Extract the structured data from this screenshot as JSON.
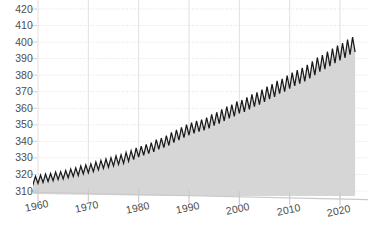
{
  "chart_data": {
    "type": "area",
    "title": "",
    "subtitle": "",
    "xlabel": "",
    "ylabel": "",
    "xlim": [
      1958,
      2023.5
    ],
    "ylim": [
      308,
      423
    ],
    "grid": true,
    "grid_style": "dotted",
    "legend": "none",
    "series_name": "Atmospheric CO2 concentration (ppm)",
    "line_color": "#1a1a1a",
    "fill_color": "#d6d6d6",
    "axis_color": "#c9c9c9",
    "grid_color": "#dcdcdc",
    "tick_text_color": "#4d4d4d",
    "ytick_labels": [
      "420",
      "410",
      "400",
      "390",
      "380",
      "370",
      "360",
      "350",
      "340",
      "330",
      "320",
      "310"
    ],
    "ytick_values": [
      420,
      410,
      400,
      390,
      380,
      370,
      360,
      350,
      340,
      330,
      320,
      310
    ],
    "xtick_labels": [
      "1960",
      "1970",
      "1980",
      "1990",
      "2000",
      "2010",
      "2020"
    ],
    "xtick_values": [
      1960,
      1970,
      1980,
      1990,
      2000,
      2010,
      2020
    ],
    "x": [
      1958.5,
      1959,
      1959.5,
      1960,
      1960.5,
      1961,
      1961.5,
      1962,
      1962.5,
      1963,
      1963.5,
      1964,
      1964.5,
      1965,
      1965.5,
      1966,
      1966.5,
      1967,
      1967.5,
      1968,
      1968.5,
      1969,
      1969.5,
      1970,
      1970.5,
      1971,
      1971.5,
      1972,
      1972.5,
      1973,
      1973.5,
      1974,
      1974.5,
      1975,
      1975.5,
      1976,
      1976.5,
      1977,
      1977.5,
      1978,
      1978.5,
      1979,
      1979.5,
      1980,
      1980.5,
      1981,
      1981.5,
      1982,
      1982.5,
      1983,
      1983.5,
      1984,
      1984.5,
      1985,
      1985.5,
      1986,
      1986.5,
      1987,
      1987.5,
      1988,
      1988.5,
      1989,
      1989.5,
      1990,
      1990.5,
      1991,
      1991.5,
      1992,
      1992.5,
      1993,
      1993.5,
      1994,
      1994.5,
      1995,
      1995.5,
      1996,
      1996.5,
      1997,
      1997.5,
      1998,
      1998.5,
      1999,
      1999.5,
      2000,
      2000.5,
      2001,
      2001.5,
      2002,
      2002.5,
      2003,
      2003.5,
      2004,
      2004.5,
      2005,
      2005.5,
      2006,
      2006.5,
      2007,
      2007.5,
      2008,
      2008.5,
      2009,
      2009.5,
      2010,
      2010.5,
      2011,
      2011.5,
      2012,
      2012.5,
      2013,
      2013.5,
      2014,
      2014.5,
      2015,
      2015.5,
      2016,
      2016.5,
      2017,
      2017.5,
      2018,
      2018.5,
      2019,
      2019.5,
      2020,
      2020.5,
      2021,
      2021.5,
      2022,
      2022.5,
      2023
    ],
    "y": [
      318.1,
      313.9,
      318.9,
      314.6,
      319.6,
      315.1,
      320.2,
      315.8,
      320.6,
      316.2,
      321.4,
      317.0,
      321.7,
      317.3,
      322.4,
      318.0,
      323.3,
      318.8,
      324.0,
      319.4,
      325.1,
      320.4,
      325.8,
      321.0,
      326.4,
      321.7,
      327.5,
      322.8,
      328.5,
      323.7,
      329.3,
      324.4,
      330.1,
      325.1,
      331.2,
      326.1,
      331.9,
      326.7,
      333.3,
      328.0,
      334.4,
      329.0,
      336.0,
      330.5,
      337.1,
      331.6,
      338.2,
      332.6,
      339.2,
      333.6,
      341.0,
      335.2,
      342.0,
      336.2,
      343.5,
      337.5,
      345.4,
      339.2,
      347.0,
      340.8,
      348.5,
      342.2,
      350.1,
      343.7,
      351.3,
      344.9,
      352.4,
      345.9,
      353.2,
      346.6,
      354.4,
      347.8,
      356.3,
      349.5,
      357.6,
      350.7,
      359.3,
      352.3,
      361.0,
      353.9,
      362.2,
      355.1,
      364.1,
      356.9,
      365.0,
      357.8,
      366.6,
      359.3,
      368.4,
      361.0,
      369.6,
      362.2,
      371.3,
      363.8,
      373.1,
      365.5,
      374.6,
      366.9,
      376.6,
      368.8,
      377.8,
      370.0,
      379.7,
      371.8,
      381.5,
      373.5,
      383.0,
      374.9,
      384.5,
      376.3,
      386.2,
      378.0,
      388.3,
      380.0,
      390.7,
      382.2,
      392.2,
      383.7,
      394.2,
      385.5,
      396.1,
      387.3,
      397.9,
      389.0,
      399.4,
      390.4,
      401.5,
      392.4,
      403.0,
      393.9,
      405.2,
      396.0,
      407.0,
      397.7,
      408.5,
      399.1,
      410.6,
      401.2,
      412.2,
      402.7,
      414.3,
      404.6,
      416.4,
      406.6,
      418.5,
      408.5,
      420.0,
      410.0,
      421.0,
      411.0,
      422.0
    ],
    "annual_mean": [
      {
        "year": 1958,
        "ppm": 315.3
      },
      {
        "year": 1960,
        "ppm": 316.9
      },
      {
        "year": 1970,
        "ppm": 325.7
      },
      {
        "year": 1980,
        "ppm": 338.8
      },
      {
        "year": 1990,
        "ppm": 354.4
      },
      {
        "year": 2000,
        "ppm": 369.6
      },
      {
        "year": 2010,
        "ppm": 389.9
      },
      {
        "year": 2020,
        "ppm": 414.2
      },
      {
        "year": 2023,
        "ppm": 421.0
      }
    ]
  }
}
